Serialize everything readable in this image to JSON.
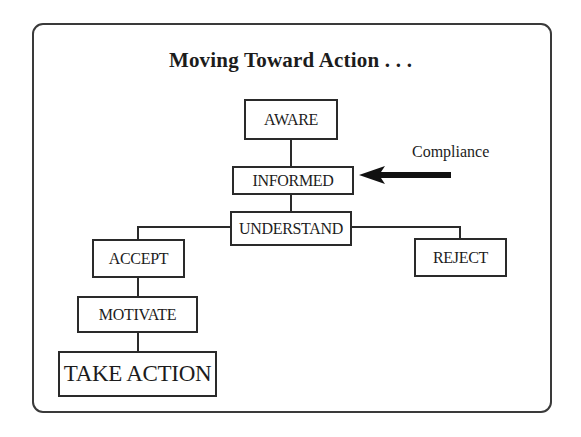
{
  "diagram": {
    "title": "Moving Toward Action . . .",
    "nodes": {
      "aware": "AWARE",
      "informed": "INFORMED",
      "understand": "UNDERSTAND",
      "accept": "ACCEPT",
      "reject": "REJECT",
      "motivate": "MOTIVATE",
      "take_action": "TAKE ACTION"
    },
    "annotation": {
      "label": "Compliance",
      "arrow_icon": "left-arrow-icon",
      "points_to": "INFORMED"
    },
    "edges": [
      [
        "AWARE",
        "INFORMED"
      ],
      [
        "INFORMED",
        "UNDERSTAND"
      ],
      [
        "UNDERSTAND",
        "ACCEPT"
      ],
      [
        "UNDERSTAND",
        "REJECT"
      ],
      [
        "ACCEPT",
        "MOTIVATE"
      ],
      [
        "MOTIVATE",
        "TAKE ACTION"
      ]
    ]
  }
}
